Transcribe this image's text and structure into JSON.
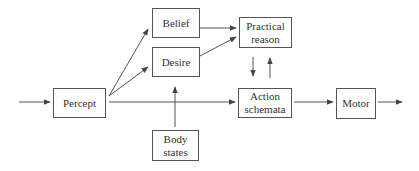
{
  "diagram": {
    "nodes": [
      {
        "id": "percept",
        "label": "Percept"
      },
      {
        "id": "belief",
        "label": "Belief"
      },
      {
        "id": "desire",
        "label": "Desire"
      },
      {
        "id": "body_states",
        "label_line1": "Body",
        "label_line2": "states"
      },
      {
        "id": "practical_reason",
        "label_line1": "Practical",
        "label_line2": "reason"
      },
      {
        "id": "action_schemata",
        "label_line1": "Action",
        "label_line2": "schemata"
      },
      {
        "id": "motor",
        "label": "Motor"
      }
    ],
    "edges": [
      {
        "from": "input",
        "to": "percept"
      },
      {
        "from": "percept",
        "to": "belief"
      },
      {
        "from": "percept",
        "to": "desire"
      },
      {
        "from": "percept",
        "to": "action_schemata"
      },
      {
        "from": "body_states",
        "to": "desire"
      },
      {
        "from": "belief",
        "to": "practical_reason"
      },
      {
        "from": "desire",
        "to": "practical_reason"
      },
      {
        "from": "practical_reason",
        "to": "action_schemata"
      },
      {
        "from": "action_schemata",
        "to": "practical_reason"
      },
      {
        "from": "action_schemata",
        "to": "motor"
      },
      {
        "from": "motor",
        "to": "output"
      }
    ],
    "colors": {
      "stroke": "#555555",
      "text": "#333333",
      "background": "#ffffff"
    }
  }
}
